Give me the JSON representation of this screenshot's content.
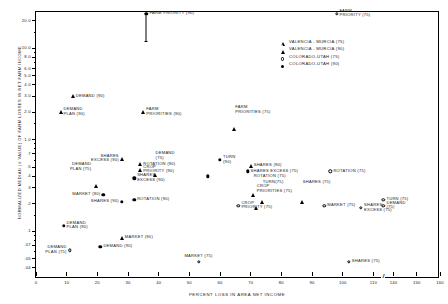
{
  "chart_data": {
    "type": "scatter",
    "title": "",
    "xlabel": "PERCENT LOSS IN AREA NET INCOME",
    "ylabel": "NORMALIZED MEDIAN (X VALUE) OF FARM LOSSES IN NET FARM INCOME",
    "xlim": [
      0,
      160
    ],
    "ylim": [
      0.03,
      25
    ],
    "yscale": "log",
    "grid": false,
    "axis_break": {
      "after": 110,
      "before": 140,
      "glyph": "//"
    },
    "xticks": [
      0,
      10,
      20,
      30,
      40,
      50,
      60,
      70,
      80,
      90,
      100,
      110,
      140,
      150,
      160
    ],
    "yticks_major": [
      {
        "v": 20.0,
        "label": "20.0"
      },
      {
        "v": 10.0,
        "label": "10.0"
      },
      {
        "v": 8.0,
        "label": "8.0"
      },
      {
        "v": 6.0,
        "label": "6.0"
      },
      {
        "v": 5.0,
        "label": "5.0"
      },
      {
        "v": 4.0,
        "label": "4.0"
      },
      {
        "v": 3.0,
        "label": "3.0"
      },
      {
        "v": 2.0,
        "label": "2.0"
      },
      {
        "v": 1.0,
        "label": "1.0"
      },
      {
        "v": 0.7,
        "label": ".7"
      },
      {
        "v": 0.5,
        "label": ".5"
      },
      {
        "v": 0.4,
        "label": ".4"
      },
      {
        "v": 0.3,
        "label": ".3"
      },
      {
        "v": 0.2,
        "label": ".2"
      },
      {
        "v": 0.1,
        "label": ".1"
      },
      {
        "v": 0.07,
        "label": ".07"
      },
      {
        "v": 0.05,
        "label": ".05"
      },
      {
        "v": 0.04,
        "label": ".04"
      }
    ],
    "yticks_minor": [
      15.0,
      9.0,
      7.0,
      1.5,
      0.9,
      0.8,
      0.6,
      0.15,
      0.09,
      0.08,
      0.06
    ],
    "legend": {
      "position": "top-right-inside",
      "entries": [
        {
          "marker": "open-triangle",
          "label": "VALENCIA - MURCIA (75)"
        },
        {
          "marker": "filled-triangle",
          "label": "VALENCIA - MURCIA (90)"
        },
        {
          "marker": "open-circle",
          "label": "COLORADO-UTAH  (75)"
        },
        {
          "marker": "filled-circle",
          "label": "COLORADO-UTAH  (90)"
        }
      ]
    },
    "points": [
      {
        "id": "farm-priority-90",
        "x": 36,
        "y": 24.0,
        "marker": "filled-circle",
        "label": "FARM PRIORITY (90)",
        "pos": "r",
        "error_low": 12.0,
        "error_high": 24.0
      },
      {
        "id": "farm-priority-75",
        "x": 98,
        "y": 24.0,
        "marker": "open-circle",
        "label": "FARM\nPRIORITY (75)",
        "pos": "r2"
      },
      {
        "id": "demand-90",
        "x": 12,
        "y": 3.0,
        "marker": "filled-triangle",
        "label": "DEMAND (90)",
        "pos": "r"
      },
      {
        "id": "demand-plan-90",
        "x": 8,
        "y": 2.0,
        "marker": "filled-triangle",
        "label": "DEMAND\nPLAN (90)",
        "pos": "r2"
      },
      {
        "id": "farm-priorities-90",
        "x": 35,
        "y": 2.0,
        "marker": "filled-triangle",
        "label": "FARM\nPRIORITIES (90)",
        "pos": "r2"
      },
      {
        "id": "farm-priorities-75",
        "x": 64,
        "y": 2.1,
        "marker": "open-triangle",
        "label": "FARM\nPRIORITIES (75)",
        "pos": "r2"
      },
      {
        "id": "shares-excess-90",
        "x": 28,
        "y": 0.62,
        "marker": "filled-triangle",
        "label": "SHARES\nEXCESS (90)",
        "pos": "l2"
      },
      {
        "id": "demand-plan-75",
        "x": 19,
        "y": 0.5,
        "marker": "open-triangle",
        "label": "DEMAND\nPLAN (75)",
        "pos": "l2"
      },
      {
        "id": "demand-75",
        "x": 38,
        "y": 0.66,
        "marker": "open-triangle",
        "label": "DEMAND\n(75)",
        "pos": "r2"
      },
      {
        "id": "rotation-90",
        "x": 34,
        "y": 0.54,
        "marker": "filled-triangle",
        "label": "ROTATION (90)",
        "pos": "r"
      },
      {
        "id": "crop-priority-90",
        "x": 34,
        "y": 0.47,
        "marker": "filled-triangle",
        "label": "CROP\nPRIORITY (90)",
        "pos": "r2"
      },
      {
        "id": "shares-excess-70",
        "x": 32,
        "y": 0.38,
        "marker": "filled-circle",
        "label": "SHARES\nEXCESS (90)",
        "pos": "r2"
      },
      {
        "id": "turn-90",
        "x": 60,
        "y": 0.6,
        "marker": "filled-circle",
        "label": "TURN\n(90)",
        "pos": "r2"
      },
      {
        "id": "turn-90b",
        "x": 56,
        "y": 0.4,
        "marker": "filled-circle",
        "label": "",
        "pos": "r"
      },
      {
        "id": "shares-90",
        "x": 70,
        "y": 0.52,
        "marker": "filled-triangle",
        "label": "SHARES (90)",
        "pos": "r"
      },
      {
        "id": "shares-excess-75",
        "x": 69,
        "y": 0.45,
        "marker": "filled-circle",
        "label": "SHARES EXCESS (75)",
        "pos": "r"
      },
      {
        "id": "rotation-75",
        "x": 70,
        "y": 0.4,
        "marker": "open-triangle",
        "label": "ROTATION (75)",
        "pos": "r"
      },
      {
        "id": "turn-75",
        "x": 73,
        "y": 0.34,
        "marker": "open-triangle",
        "label": "TURN(75)",
        "pos": "r"
      },
      {
        "id": "shares-75",
        "x": 86,
        "y": 0.34,
        "marker": "open-triangle",
        "label": "SHARES (75)",
        "pos": "r"
      },
      {
        "id": "crop-priorities-75",
        "x": 71,
        "y": 0.29,
        "marker": "open-triangle",
        "label": "CROP\nPRIORITIES (75)",
        "pos": "r2"
      },
      {
        "id": "rotation-75b",
        "x": 96,
        "y": 0.45,
        "marker": "open-circle",
        "label": "ROTATION (75)",
        "pos": "r"
      },
      {
        "id": "market-90",
        "x": 22,
        "y": 0.25,
        "marker": "filled-circle",
        "label": "MARKET (90)",
        "pos": "l"
      },
      {
        "id": "shares-90b",
        "x": 28,
        "y": 0.21,
        "marker": "filled-circle",
        "label": "SHARES (90)",
        "pos": "l"
      },
      {
        "id": "rotation-90b",
        "x": 32,
        "y": 0.22,
        "marker": "filled-circle",
        "label": "ROTATION (90)",
        "pos": "r"
      },
      {
        "id": "crop-priority-75",
        "x": 66,
        "y": 0.19,
        "marker": "open-circle",
        "label": "CROP\nPRIORITY (75)",
        "pos": "r2"
      },
      {
        "id": "market-75b",
        "x": 94,
        "y": 0.19,
        "marker": "open-circle",
        "label": "MARKET (75)",
        "pos": "r"
      },
      {
        "id": "shares-excess-75b",
        "x": 106,
        "y": 0.18,
        "marker": "open-circle",
        "label": "SHARES\nEXCESS (75)",
        "pos": "r2"
      },
      {
        "id": "turn-75b",
        "x": 129,
        "y": 0.22,
        "marker": "open-circle",
        "label": "TURN (75)",
        "pos": "r"
      },
      {
        "id": "demand-75b",
        "x": 137,
        "y": 0.19,
        "marker": "open-circle",
        "label": "DEMAND\n(75)",
        "pos": "r2"
      },
      {
        "id": "demand-plan-90b",
        "x": 9,
        "y": 0.115,
        "marker": "filled-circle",
        "label": "DEMAND\nPLAN (90)",
        "pos": "r2"
      },
      {
        "id": "market-90b",
        "x": 28,
        "y": 0.085,
        "marker": "filled-triangle",
        "label": "MARKET (90)",
        "pos": "r"
      },
      {
        "id": "demand-90b",
        "x": 21,
        "y": 0.068,
        "marker": "filled-circle",
        "label": "DEMAND (90)",
        "pos": "r"
      },
      {
        "id": "demand-plan-75b",
        "x": 11,
        "y": 0.062,
        "marker": "open-circle",
        "label": "DEMAND\nPLAN (75)",
        "pos": "l2"
      },
      {
        "id": "market-75",
        "x": 53,
        "y": 0.046,
        "marker": "open-circle",
        "label": "MARKET (75)",
        "pos": "t"
      },
      {
        "id": "shares-75b",
        "x": 102,
        "y": 0.046,
        "marker": "open-circle",
        "label": "SHARES (75)",
        "pos": "r"
      }
    ]
  }
}
